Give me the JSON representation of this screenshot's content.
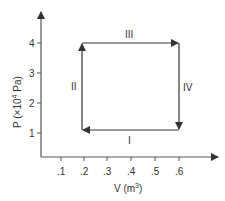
{
  "diagram": {
    "type": "pV cycle diagram",
    "y_axis": {
      "label": "P (×10⁴ Pa)",
      "label_prefix": "P (×10",
      "label_sup": "4",
      "label_suffix": " Pa)",
      "ticks": [
        "1",
        "2",
        "3",
        "4"
      ]
    },
    "x_axis": {
      "label_prefix": "V (m",
      "label_sup": "3",
      "label_suffix": ")",
      "ticks": [
        ".1",
        ".2",
        ".3",
        ".4",
        ".5",
        ".6"
      ]
    },
    "processes": [
      {
        "label": "I",
        "from": {
          "V": 0.6,
          "P": 1.1
        },
        "to": {
          "V": 0.2,
          "P": 1.1
        },
        "direction": "left"
      },
      {
        "label": "II",
        "from": {
          "V": 0.2,
          "P": 1.1
        },
        "to": {
          "V": 0.2,
          "P": 4
        },
        "direction": "up"
      },
      {
        "label": "III",
        "from": {
          "V": 0.2,
          "P": 4
        },
        "to": {
          "V": 0.6,
          "P": 4
        },
        "direction": "right"
      },
      {
        "label": "IV",
        "from": {
          "V": 0.6,
          "P": 4
        },
        "to": {
          "V": 0.6,
          "P": 1.1
        },
        "direction": "down"
      }
    ],
    "colors": {
      "line": "#333333",
      "background": "#ffffff"
    }
  }
}
